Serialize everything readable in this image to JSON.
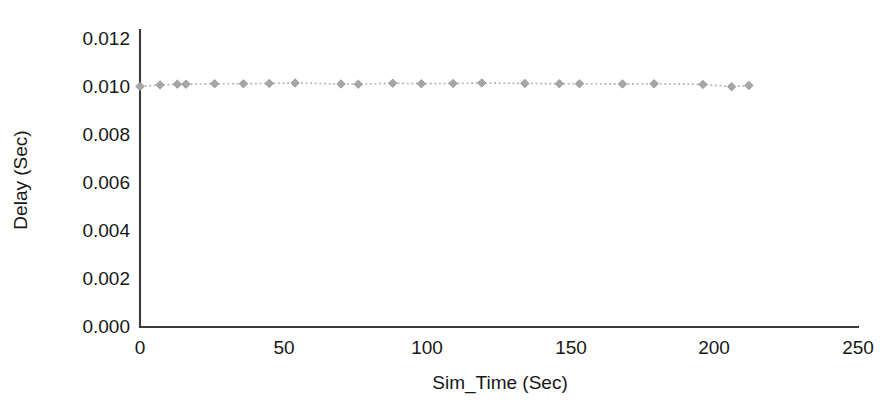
{
  "figure": {
    "background_color": "#ffffff",
    "axis_color": "#3b3b3b",
    "series_color": "#a6a6a6"
  },
  "axes": {
    "x_title": "Sim_Time (Sec)",
    "y_title": "Delay (Sec)",
    "x_ticks": [
      "0",
      "50",
      "100",
      "150",
      "200",
      "250"
    ],
    "y_ticks": [
      "0.000",
      "0.002",
      "0.004",
      "0.006",
      "0.008",
      "0.010",
      "0.012"
    ]
  },
  "chart_data": {
    "type": "line",
    "title": "",
    "xlabel": "Sim_Time (Sec)",
    "ylabel": "Delay (Sec)",
    "xlim": [
      0,
      250
    ],
    "ylim": [
      0.0,
      0.012
    ],
    "xticks": [
      0,
      50,
      100,
      150,
      200,
      250
    ],
    "yticks": [
      0.0,
      0.002,
      0.004,
      0.006,
      0.008,
      0.01,
      0.012
    ],
    "grid": false,
    "legend": null,
    "marker": "diamond",
    "linestyle": "dotted",
    "color": "#a6a6a6",
    "series": [
      {
        "name": "Delay",
        "x": [
          0,
          7,
          13,
          16,
          26,
          36,
          45,
          54,
          70,
          76,
          88,
          98,
          109,
          119,
          134,
          146,
          153,
          168,
          179,
          196,
          206,
          212
        ],
        "y": [
          0.00972,
          0.00978,
          0.00981,
          0.00981,
          0.00983,
          0.00983,
          0.00984,
          0.00986,
          0.00982,
          0.00981,
          0.00985,
          0.00983,
          0.00984,
          0.00986,
          0.00984,
          0.00983,
          0.00983,
          0.00982,
          0.00983,
          0.0098,
          0.00971,
          0.00976
        ]
      }
    ]
  }
}
